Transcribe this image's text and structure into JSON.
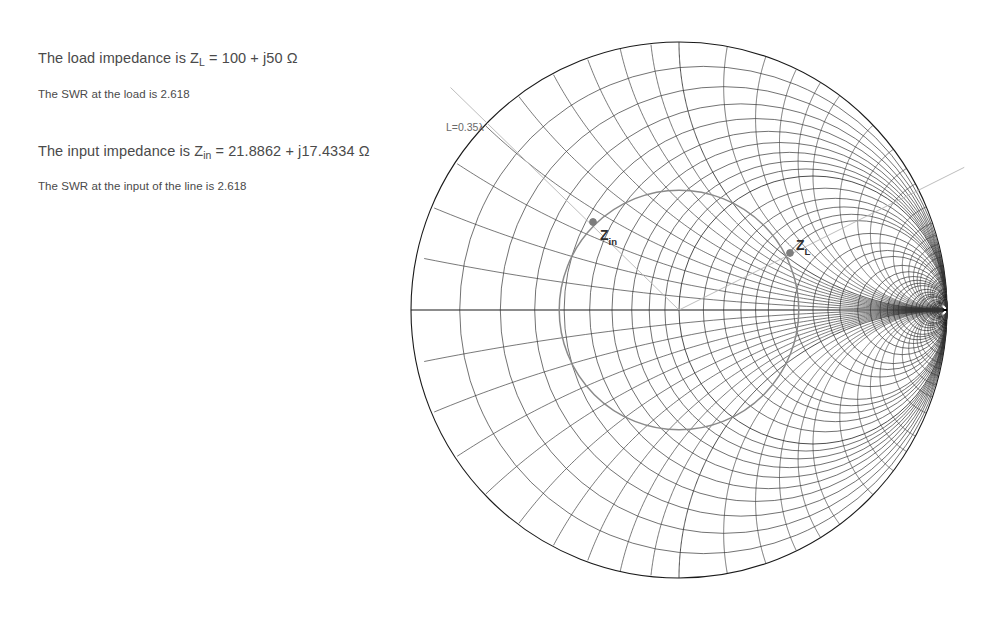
{
  "background": "#ffffff",
  "readout": {
    "lines": [
      {
        "id": "load-impedance",
        "prefix": "The load impedance is Z",
        "subscript": "L",
        "suffix": " = 100 + j50 Ω",
        "size": "big",
        "x": 38,
        "y": 50
      },
      {
        "id": "load-swr",
        "prefix": "The SWR at the load is 2.618",
        "subscript": "",
        "suffix": "",
        "size": "small",
        "x": 38,
        "y": 88
      },
      {
        "id": "input-impedance",
        "prefix": "The input impedance is Z",
        "subscript": "in",
        "suffix": " = 21.8862 + j17.4334 Ω",
        "size": "big",
        "x": 38,
        "y": 143
      },
      {
        "id": "input-swr",
        "prefix": "The SWR at the input of the line is 2.618",
        "subscript": "",
        "suffix": "",
        "size": "small",
        "x": 38,
        "y": 180
      }
    ]
  },
  "chart_data": {
    "type": "smith-chart",
    "title": "",
    "xlabel": "",
    "ylabel": "",
    "grid": true,
    "legend": "none",
    "normalizing_impedance_ohms": 50,
    "geometry": {
      "center_x": 679,
      "center_y": 310,
      "radius": 268,
      "outer_circle_color": "#1a1a1a",
      "grid_color": "#333333",
      "accent_color": "#9a9a9a"
    },
    "resistance_circles": [
      0,
      0.1,
      0.2,
      0.3,
      0.4,
      0.5,
      0.6,
      0.7,
      0.8,
      0.9,
      1,
      1.2,
      1.4,
      1.6,
      1.8,
      2,
      2.5,
      3,
      3.5,
      4,
      5,
      6,
      7,
      8,
      9,
      10,
      12,
      14,
      16,
      18,
      20,
      25,
      30,
      35,
      40,
      50
    ],
    "reactance_arcs": [
      0.1,
      0.2,
      0.3,
      0.4,
      0.5,
      0.6,
      0.7,
      0.8,
      0.9,
      1,
      1.2,
      1.4,
      1.6,
      1.8,
      2,
      2.5,
      3,
      3.5,
      4,
      5,
      6,
      7,
      8,
      9,
      10,
      12,
      14,
      16,
      18,
      20,
      25,
      30,
      35,
      40,
      50
    ],
    "swr_circle": {
      "swr": 2.618,
      "gamma_magnitude": 0.447,
      "color": "#8a8a8a"
    },
    "points": [
      {
        "name": "Z_L",
        "label_main": "Z",
        "label_sub": "L",
        "z_normalized_real": 2.0,
        "z_normalized_imag": 1.0,
        "z_ohms": "100 + j50",
        "gamma_real": 0.4,
        "gamma_imag": 0.2,
        "px": 790,
        "py": 253,
        "label_px": 796,
        "label_py": 250,
        "color": "#7d7d7d"
      },
      {
        "name": "Z_in",
        "label_main": "Z",
        "label_sub": "in",
        "z_normalized_real": 0.437724,
        "z_normalized_imag": 0.348668,
        "z_ohms": "21.8862 + j17.4334",
        "gamma_real": -0.3199,
        "gamma_imag": 0.3117,
        "px": 593,
        "py": 222,
        "label_px": 600,
        "label_py": 240,
        "color": "#7d7d7d"
      }
    ],
    "line_length_label": {
      "text": "L=0.35λ",
      "px": 446,
      "py": 131,
      "color": "#6a6a6a"
    },
    "radial_lines": [
      {
        "name": "load-radial",
        "angle_deg": 26.57,
        "extends_beyond_edge": true,
        "color": "#b5b5b5"
      },
      {
        "name": "input-radial",
        "angle_deg": 135.76,
        "extends_beyond_edge": true,
        "color": "#b5b5b5"
      }
    ]
  }
}
